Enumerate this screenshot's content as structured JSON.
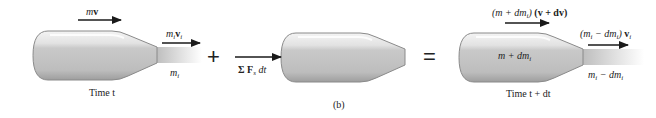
{
  "figure": {
    "panel_label": "(b)",
    "operators": {
      "plus": "+",
      "equals": "="
    }
  },
  "left_state": {
    "time_label": "Time t",
    "momentum_label": {
      "m": "m",
      "v": "v"
    },
    "exhaust_momentum_label": {
      "m": "m",
      "sub1": "i",
      "v": "v",
      "sub2": "i"
    },
    "exhaust_mass_label": {
      "m": "m",
      "sub": "i"
    }
  },
  "impulse": {
    "label": {
      "sigma": "Σ",
      "F": "F",
      "sub": "s",
      "dt": "dt"
    }
  },
  "right_state": {
    "time_label": "Time t + dt",
    "body_mass_label": "m + dm",
    "body_mass_sub": "i",
    "momentum_label": {
      "open": "(m + dm",
      "sub": "i",
      "close": ")",
      "vel": "(v + dv)"
    },
    "exhaust_momentum_label": {
      "open": "(m",
      "sub1": "i",
      "mid": " − dm",
      "sub2": "i",
      "close": ") ",
      "v": "v",
      "sub3": "i"
    },
    "exhaust_mass_label": {
      "m": "m",
      "sub1": "i",
      "mid": " − dm",
      "sub2": "i"
    }
  },
  "colors": {
    "body_light": "#ececec",
    "body_dark": "#a9a9a9",
    "outline": "#8a8a8a",
    "arrow": "#1a1a1a",
    "plume": "#c8c8c8"
  }
}
